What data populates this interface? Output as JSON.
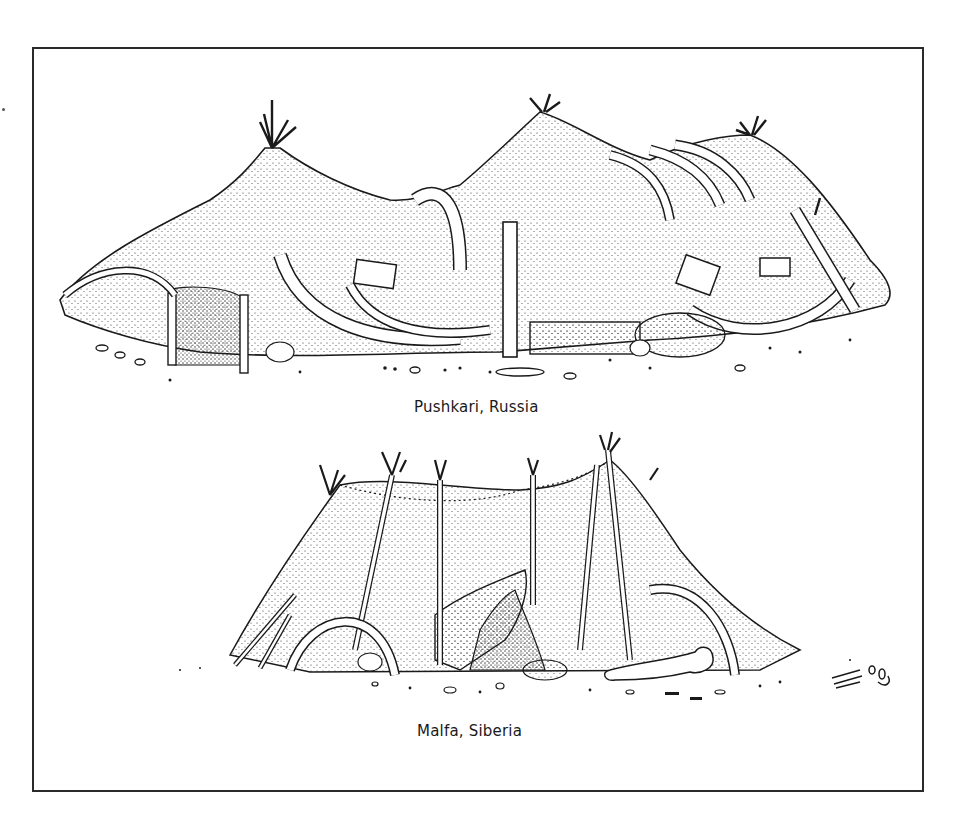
{
  "figure": {
    "panels": [
      {
        "id": "top",
        "caption": "Pushkari, Russia",
        "subject": "mammoth-bone-dwelling-illustration"
      },
      {
        "id": "bottom",
        "caption": "Malfa, Siberia",
        "subject": "hide-covered-pole-dwelling-illustration"
      }
    ],
    "colors": {
      "ink": "#1a1a1a",
      "paper": "#ffffff",
      "frame": "#2a2a2a"
    }
  }
}
